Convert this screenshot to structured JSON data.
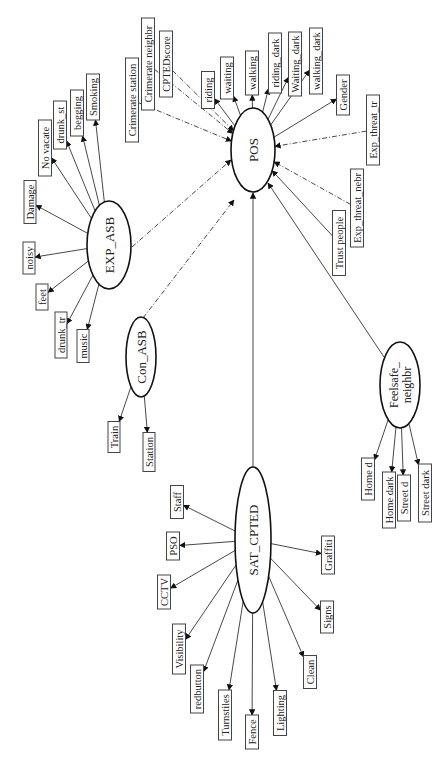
{
  "diagram": {
    "latent_nodes": [
      {
        "id": "POS",
        "label": "POS",
        "cx": 253,
        "cy": 150,
        "rx": 22,
        "ry": 42
      },
      {
        "id": "EXP_ASB",
        "label": "EXP_ASB",
        "cx": 109,
        "cy": 245,
        "rx": 22,
        "ry": 44
      },
      {
        "id": "Con_ASB",
        "label": "Con_ASB",
        "cx": 141,
        "cy": 357,
        "rx": 15,
        "ry": 40
      },
      {
        "id": "SAT_CPTED",
        "label": "SAT_CPTED",
        "cx": 253,
        "cy": 540,
        "rx": 18,
        "ry": 73
      },
      {
        "id": "Feelsafe_neighbr",
        "label": "Feelsafe_",
        "label2": "neighbr",
        "cx": 400,
        "cy": 385,
        "rx": 20,
        "ry": 43
      }
    ],
    "boxes": [
      {
        "id": "riding",
        "label": "riding",
        "cx": 208,
        "cy": 90,
        "w": 13,
        "h": 37,
        "from": "POS",
        "style": "solid"
      },
      {
        "id": "waiting",
        "label": "waiting",
        "cx": 227,
        "cy": 78,
        "w": 13,
        "h": 42,
        "from": "POS",
        "style": "solid"
      },
      {
        "id": "walking",
        "label": "walking",
        "cx": 252,
        "cy": 73,
        "w": 13,
        "h": 44,
        "from": "POS",
        "style": "solid"
      },
      {
        "id": "riding_dark",
        "label": "riding_dark",
        "cx": 275,
        "cy": 63,
        "w": 13,
        "h": 60,
        "from": "POS",
        "style": "solid"
      },
      {
        "id": "Waiting_dark",
        "label": "Waiting_dark",
        "cx": 295,
        "cy": 64,
        "w": 13,
        "h": 64,
        "from": "POS",
        "style": "solid"
      },
      {
        "id": "walking_dark",
        "label": "walking_dark",
        "cx": 316,
        "cy": 61,
        "w": 13,
        "h": 66,
        "from": "POS",
        "style": "solid"
      },
      {
        "id": "Gender",
        "label": "Gender",
        "cx": 343,
        "cy": 95,
        "w": 13,
        "h": 40,
        "from": "POS",
        "style": "solid"
      },
      {
        "id": "Exp_threat_tr",
        "label": "Exp_threat_tr",
        "cx": 373,
        "cy": 130,
        "w": 13,
        "h": 70,
        "from_to": "POS",
        "style": "dash"
      },
      {
        "id": "Exp_threat_nebr",
        "label": "Exp_threat_nebr",
        "cx": 357,
        "cy": 208,
        "w": 13,
        "h": 78,
        "from_to": "POS",
        "style": "dash"
      },
      {
        "id": "Trust_people",
        "label": "Trust people",
        "cx": 339,
        "cy": 243,
        "w": 13,
        "h": 65,
        "from_to": "POS",
        "style": "solid"
      },
      {
        "id": "Crimerate_station",
        "label": "Crimerate station",
        "cx": 132,
        "cy": 100,
        "w": 13,
        "h": 84,
        "from_to": "POS",
        "style": "dash"
      },
      {
        "id": "Crimerate_neighbr",
        "label": "Crimerate neighbr",
        "cx": 148,
        "cy": 64,
        "w": 13,
        "h": 92,
        "from_to": "POS",
        "style": "dash"
      },
      {
        "id": "CPTEDscore",
        "label": "CPTEDscore",
        "cx": 166,
        "cy": 64,
        "w": 13,
        "h": 66,
        "from_to": "POS",
        "style": "dash"
      },
      {
        "id": "Smoking",
        "label": "Smoking",
        "cx": 93,
        "cy": 97,
        "w": 13,
        "h": 46,
        "from": "EXP_ASB",
        "style": "solid"
      },
      {
        "id": "begging",
        "label": "begging",
        "cx": 77,
        "cy": 113,
        "w": 13,
        "h": 46,
        "from": "EXP_ASB",
        "style": "solid"
      },
      {
        "id": "drunk_st",
        "label": "drunk_st",
        "cx": 60,
        "cy": 125,
        "w": 13,
        "h": 48,
        "from": "EXP_ASB",
        "style": "solid"
      },
      {
        "id": "No_vacate",
        "label": "No vacate",
        "cx": 45,
        "cy": 148,
        "w": 13,
        "h": 56,
        "from": "EXP_ASB",
        "style": "solid"
      },
      {
        "id": "Damage",
        "label": "Damage",
        "cx": 30,
        "cy": 202,
        "w": 12,
        "h": 43,
        "from": "EXP_ASB",
        "style": "solid"
      },
      {
        "id": "noisy",
        "label": "noisy",
        "cx": 29,
        "cy": 258,
        "w": 12,
        "h": 32,
        "from": "EXP_ASB",
        "style": "solid"
      },
      {
        "id": "feet",
        "label": "feet",
        "cx": 42,
        "cy": 297,
        "w": 12,
        "h": 26,
        "from": "EXP_ASB",
        "style": "solid"
      },
      {
        "id": "drunk_tr",
        "label": "drunk_tr",
        "cx": 61,
        "cy": 335,
        "w": 12,
        "h": 46,
        "from": "EXP_ASB",
        "style": "solid"
      },
      {
        "id": "music",
        "label": "music",
        "cx": 83,
        "cy": 346,
        "w": 12,
        "h": 33,
        "from": "EXP_ASB",
        "style": "solid"
      },
      {
        "id": "Train",
        "label": "Train",
        "cx": 114,
        "cy": 437,
        "w": 12,
        "h": 31,
        "from": "Con_ASB",
        "style": "solid"
      },
      {
        "id": "Station",
        "label": "Station",
        "cx": 149,
        "cy": 452,
        "w": 12,
        "h": 39,
        "from": "Con_ASB",
        "style": "solid"
      },
      {
        "id": "Staff",
        "label": "Staff",
        "cx": 177,
        "cy": 502,
        "w": 13,
        "h": 33,
        "from": "SAT_CPTED",
        "style": "solid"
      },
      {
        "id": "PSO",
        "label": "PSO",
        "cx": 173,
        "cy": 546,
        "w": 13,
        "h": 28,
        "from": "SAT_CPTED",
        "style": "solid"
      },
      {
        "id": "CCTV",
        "label": "CCTV",
        "cx": 164,
        "cy": 592,
        "w": 13,
        "h": 34,
        "from": "SAT_CPTED",
        "style": "solid"
      },
      {
        "id": "Visibility",
        "label": "Visibility",
        "cx": 179,
        "cy": 649,
        "w": 13,
        "h": 50,
        "from": "SAT_CPTED",
        "style": "solid"
      },
      {
        "id": "redbutton",
        "label": "redbutton",
        "cx": 197,
        "cy": 689,
        "w": 13,
        "h": 48,
        "from": "SAT_CPTED",
        "style": "solid"
      },
      {
        "id": "Turnstiles",
        "label": "Turnstiles",
        "cx": 225,
        "cy": 715,
        "w": 13,
        "h": 50,
        "from": "SAT_CPTED",
        "style": "solid"
      },
      {
        "id": "Fence",
        "label": "Fence",
        "cx": 252,
        "cy": 732,
        "w": 13,
        "h": 34,
        "from": "SAT_CPTED",
        "style": "solid"
      },
      {
        "id": "Lighting",
        "label": "Lighting",
        "cx": 280,
        "cy": 713,
        "w": 13,
        "h": 45,
        "from": "SAT_CPTED",
        "style": "solid"
      },
      {
        "id": "Clean",
        "label": "Clean",
        "cx": 310,
        "cy": 672,
        "w": 13,
        "h": 33,
        "from": "SAT_CPTED",
        "style": "solid"
      },
      {
        "id": "Signs",
        "label": "Signs",
        "cx": 327,
        "cy": 617,
        "w": 13,
        "h": 32,
        "from": "SAT_CPTED",
        "style": "solid"
      },
      {
        "id": "Graffiti",
        "label": "Graffiti",
        "cx": 328,
        "cy": 555,
        "w": 13,
        "h": 38,
        "from": "SAT_CPTED",
        "style": "solid"
      },
      {
        "id": "Home_d",
        "label": "Home d",
        "cx": 368,
        "cy": 479,
        "w": 13,
        "h": 42,
        "from": "Feelsafe_neighbr",
        "style": "solid"
      },
      {
        "id": "Home_dark",
        "label": "Home dark",
        "cx": 389,
        "cy": 500,
        "w": 13,
        "h": 56,
        "from": "Feelsafe_neighbr",
        "style": "solid"
      },
      {
        "id": "Street_d",
        "label": "Street d",
        "cx": 404,
        "cy": 498,
        "w": 13,
        "h": 46,
        "from": "Feelsafe_neighbr",
        "style": "solid"
      },
      {
        "id": "Street_dark",
        "label": "Street dark",
        "cx": 425,
        "cy": 493,
        "w": 13,
        "h": 58,
        "from": "Feelsafe_neighbr",
        "style": "solid"
      }
    ],
    "latent_edges": [
      {
        "from": "EXP_ASB",
        "to": "POS",
        "style": "dash",
        "x1": 132,
        "y1": 247,
        "x2": 231,
        "y2": 160
      },
      {
        "from": "Con_ASB",
        "to": "POS",
        "style": "dash",
        "x1": 143,
        "y1": 318,
        "x2": 234,
        "y2": 200
      },
      {
        "from": "SAT_CPTED",
        "to": "POS",
        "style": "solid",
        "x1": 253,
        "y1": 467,
        "x2": 253,
        "y2": 193
      },
      {
        "from": "Feelsafe_neighbr",
        "to": "POS",
        "style": "solid",
        "x1": 384,
        "y1": 357,
        "x2": 268,
        "y2": 183
      }
    ]
  }
}
